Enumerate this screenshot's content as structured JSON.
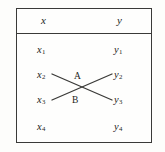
{
  "figure": {
    "type": "mapping-diagram",
    "background_color": "#fdfdfb",
    "line_color": "#3a3a38",
    "text_color": "#1d1d1b"
  },
  "table": {
    "headers": {
      "left": "x",
      "right": "y"
    },
    "rows": [
      {
        "left": "x",
        "left_sub": "1",
        "right": "y",
        "right_sub": "1"
      },
      {
        "left": "x",
        "left_sub": "2",
        "right": "y",
        "right_sub": "2"
      },
      {
        "left": "x",
        "left_sub": "3",
        "right": "y",
        "right_sub": "3"
      },
      {
        "left": "x",
        "left_sub": "4",
        "right": "y",
        "right_sub": "4"
      }
    ]
  },
  "annotations": [
    {
      "label": "A",
      "meaning": "segment from x2 to y3"
    },
    {
      "label": "B",
      "meaning": "segment from x3 to y2"
    }
  ],
  "connections": [
    {
      "name": "x2-to-y3",
      "from": "x2",
      "to": "y3",
      "x1": 52,
      "y1": 74,
      "x2": 112,
      "y2": 100
    },
    {
      "name": "x3-to-y2",
      "from": "x3",
      "to": "y2",
      "x1": 52,
      "y1": 100,
      "x2": 112,
      "y2": 74
    }
  ]
}
